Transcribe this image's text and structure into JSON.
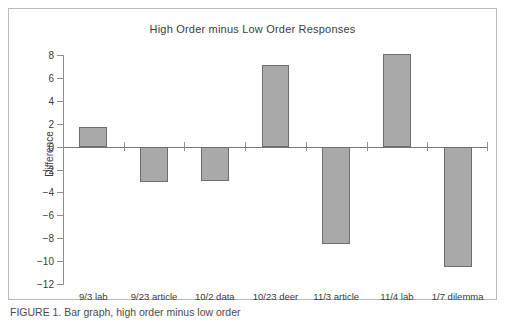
{
  "figure": {
    "caption": "FIGURE 1. Bar graph, high order minus low order"
  },
  "chart_data": {
    "type": "bar",
    "title": "High Order minus Low Order Responses",
    "xlabel": "",
    "ylabel": "Difference",
    "categories": [
      "9/3 lab",
      "9/23 article",
      "10/2 data",
      "10/23 deer",
      "11/3 article",
      "11/4 lab",
      "1/7 dilemma"
    ],
    "values": [
      1.7,
      -3.05,
      -3.0,
      7.1,
      -8.5,
      8.1,
      -10.5
    ],
    "ylim": [
      -12,
      8
    ],
    "ytick_step": 2,
    "yticks": [
      8,
      6,
      4,
      2,
      0,
      -2,
      -4,
      -6,
      -8,
      -10,
      -12
    ],
    "ytick_labels": [
      "8",
      "6",
      "4",
      "2",
      "0",
      "-2",
      "-4",
      "-6",
      "-8",
      "-10",
      "-12"
    ],
    "grid": false,
    "legend": null,
    "bar_fill_color": "#a9a9a9",
    "bar_edge_color": "#6e6e6e",
    "axis_color": "#8e8e8e",
    "zero_line": 0
  }
}
